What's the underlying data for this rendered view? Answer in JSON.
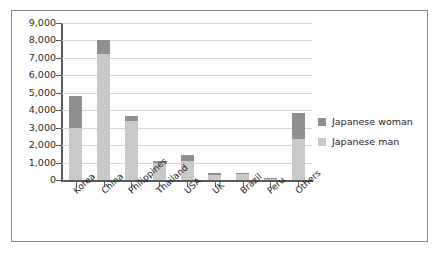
{
  "chart_data": {
    "type": "bar",
    "subtype": "stacked-bar",
    "title": "",
    "xlabel": "",
    "ylabel": "",
    "ylim": [
      0,
      9000
    ],
    "ytick_labels": [
      "9,000",
      "8,000",
      "7,000",
      "6,000",
      "5,000",
      "4,000",
      "3,000",
      "2,000",
      "1,000",
      "0"
    ],
    "ytick_values": [
      9000,
      8000,
      7000,
      6000,
      5000,
      4000,
      3000,
      2000,
      1000,
      0
    ],
    "grid": true,
    "legend_position": "right",
    "categories": [
      "Korea",
      "China",
      "Philippines",
      "Thailand",
      "USA",
      "UK",
      "Brazil",
      "Peru",
      "Others"
    ],
    "series": [
      {
        "name": "Japanese woman",
        "color": "#8f8f8f",
        "values": [
          1800,
          800,
          250,
          120,
          350,
          90,
          110,
          30,
          1500
        ]
      },
      {
        "name": "Japanese man",
        "color": "#c9c9c9",
        "values": [
          3000,
          7200,
          3400,
          980,
          1100,
          310,
          320,
          90,
          2350
        ]
      }
    ],
    "totals": [
      4800,
      8000,
      3650,
      1100,
      1450,
      400,
      430,
      120,
      3850
    ]
  },
  "legend": {
    "items": [
      {
        "label": "Japanese woman",
        "color": "#8f8f8f"
      },
      {
        "label": "Japanese man",
        "color": "#c9c9c9"
      }
    ]
  }
}
